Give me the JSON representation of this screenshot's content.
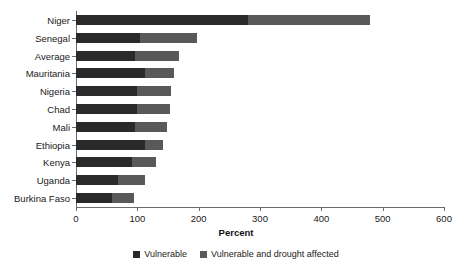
{
  "figure": {
    "cropped_header_text": "",
    "axis_title": "Percent"
  },
  "legend": {
    "position": "bottom-center",
    "items": [
      {
        "label": "Vulnerable",
        "color": "#2a2a2a",
        "swatch_name": "legend-swatch-vulnerable"
      },
      {
        "label": "Vulnerable and drought affected",
        "color": "#595959",
        "swatch_name": "legend-swatch-drought-affected"
      }
    ]
  },
  "chart_data": {
    "type": "bar",
    "orientation": "horizontal",
    "stacked": true,
    "title": "",
    "xlabel": "Percent",
    "ylabel": "",
    "xlim": [
      0,
      600
    ],
    "xticks": [
      0,
      100,
      200,
      300,
      400,
      500,
      600
    ],
    "xtick_labels": [
      "0",
      "100",
      "200",
      "300",
      "400",
      "500",
      "600"
    ],
    "grid": false,
    "legend_position": "bottom",
    "categories": [
      "Niger",
      "Senegal",
      "Average",
      "Mauritania",
      "Nigeria",
      "Chad",
      "Mali",
      "Ethiopia",
      "Kenya",
      "Uganda",
      "Burkina Faso"
    ],
    "series": [
      {
        "name": "Vulnerable",
        "color": "#2a2a2a",
        "values": [
          280,
          104,
          97,
          112,
          100,
          100,
          97,
          112,
          92,
          69,
          58
        ]
      },
      {
        "name": "Vulnerable and drought affected",
        "color": "#595959",
        "values": [
          200,
          93,
          71,
          48,
          55,
          53,
          51,
          30,
          38,
          44,
          36
        ]
      }
    ],
    "totals": [
      480,
      197,
      168,
      160,
      155,
      153,
      148,
      142,
      130,
      113,
      94
    ]
  }
}
